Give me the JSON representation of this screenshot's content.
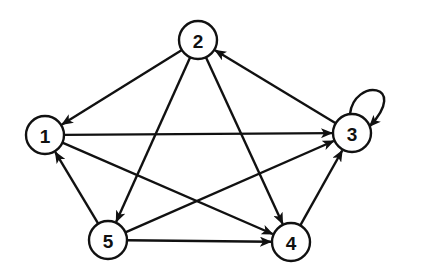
{
  "diagram": {
    "type": "directed-graph",
    "style": {
      "stroke_color": "#111111",
      "background": "#ffffff",
      "node_radius": 19
    },
    "nodes": [
      {
        "id": "1",
        "label": "1",
        "x": 45,
        "y": 135
      },
      {
        "id": "2",
        "label": "2",
        "x": 198,
        "y": 40
      },
      {
        "id": "3",
        "label": "3",
        "x": 352,
        "y": 133
      },
      {
        "id": "4",
        "label": "4",
        "x": 291,
        "y": 242
      },
      {
        "id": "5",
        "label": "5",
        "x": 108,
        "y": 240
      }
    ],
    "edges": [
      {
        "from": "2",
        "to": "1"
      },
      {
        "from": "2",
        "to": "5"
      },
      {
        "from": "2",
        "to": "4"
      },
      {
        "from": "3",
        "to": "2"
      },
      {
        "from": "3",
        "to": "3"
      },
      {
        "from": "1",
        "to": "3"
      },
      {
        "from": "1",
        "to": "4"
      },
      {
        "from": "5",
        "to": "1"
      },
      {
        "from": "5",
        "to": "3"
      },
      {
        "from": "5",
        "to": "4"
      },
      {
        "from": "4",
        "to": "3"
      }
    ]
  }
}
